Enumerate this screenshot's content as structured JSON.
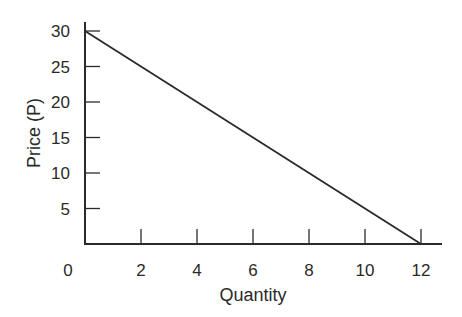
{
  "chart_data": {
    "type": "line",
    "title": "",
    "xlabel": "Quantity",
    "ylabel": "Price (P)",
    "x": [
      0,
      12
    ],
    "series": [
      {
        "name": "Demand",
        "x": [
          0,
          12
        ],
        "y": [
          30,
          0
        ],
        "color": "#2a2a2a"
      }
    ],
    "xticks": [
      2,
      4,
      6,
      8,
      10,
      12
    ],
    "yticks": [
      5,
      10,
      15,
      20,
      25,
      30
    ],
    "xtick_labels": [
      "0",
      "2",
      "4",
      "6",
      "8",
      "10",
      "12"
    ],
    "ytick_labels": [
      "5",
      "10",
      "15",
      "20",
      "25",
      "30"
    ],
    "xlim": [
      0,
      12.8
    ],
    "ylim": [
      0,
      31.5
    ],
    "grid": false,
    "legend": "none"
  },
  "labels": {
    "origin": "0",
    "x_axis": "Quantity",
    "y_axis": "Price (P)"
  }
}
